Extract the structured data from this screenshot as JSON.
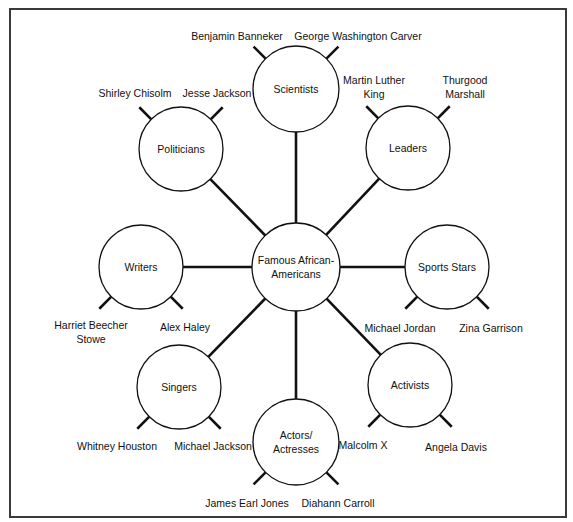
{
  "center": {
    "lines": [
      "Famous African-",
      "Americans"
    ]
  },
  "categories": [
    {
      "id": "scientists",
      "lines": [
        "Scientists"
      ],
      "examples": [
        {
          "lines": [
            "Benjamin Banneker"
          ]
        },
        {
          "lines": [
            "George Washington Carver"
          ]
        }
      ]
    },
    {
      "id": "leaders",
      "lines": [
        "Leaders"
      ],
      "examples": [
        {
          "lines": [
            "Martin Luther",
            "King"
          ]
        },
        {
          "lines": [
            "Thurgood",
            "Marshall"
          ]
        }
      ]
    },
    {
      "id": "sports-stars",
      "lines": [
        "Sports Stars"
      ],
      "examples": [
        {
          "lines": [
            "Michael Jordan"
          ]
        },
        {
          "lines": [
            "Zina Garrison"
          ]
        }
      ]
    },
    {
      "id": "activists",
      "lines": [
        "Activists"
      ],
      "examples": [
        {
          "lines": [
            "Malcolm X"
          ]
        },
        {
          "lines": [
            "Angela Davis"
          ]
        }
      ]
    },
    {
      "id": "actors-actresses",
      "lines": [
        "Actors/",
        "Actresses"
      ],
      "examples": [
        {
          "lines": [
            "James Earl Jones"
          ]
        },
        {
          "lines": [
            "Diahann Carroll"
          ]
        }
      ]
    },
    {
      "id": "singers",
      "lines": [
        "Singers"
      ],
      "examples": [
        {
          "lines": [
            "Whitney Houston"
          ]
        },
        {
          "lines": [
            "Michael Jackson"
          ]
        }
      ]
    },
    {
      "id": "writers",
      "lines": [
        "Writers"
      ],
      "examples": [
        {
          "lines": [
            "Harriet Beecher",
            "Stowe"
          ]
        },
        {
          "lines": [
            "Alex Haley"
          ]
        }
      ]
    },
    {
      "id": "politicians",
      "lines": [
        "Politicians"
      ],
      "examples": [
        {
          "lines": [
            "Shirley Chisolm"
          ]
        },
        {
          "lines": [
            "Jesse Jackson"
          ]
        }
      ]
    }
  ]
}
